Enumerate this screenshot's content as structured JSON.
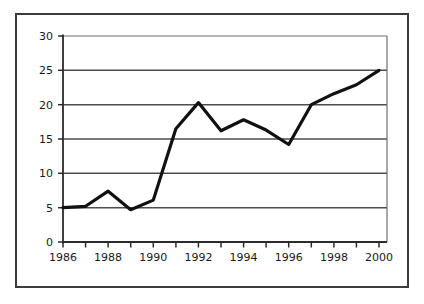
{
  "chart_data": {
    "type": "line",
    "title": "",
    "subtitle": "",
    "xlabel": "",
    "ylabel": "",
    "x": [
      1986,
      1987,
      1988,
      1989,
      1990,
      1991,
      1992,
      1993,
      1994,
      1995,
      1996,
      1997,
      1998,
      1999,
      2000
    ],
    "values": [
      5.0,
      5.2,
      7.4,
      4.7,
      6.1,
      16.5,
      20.3,
      16.2,
      17.8,
      16.3,
      14.2,
      20.0,
      21.6,
      22.9,
      25.0
    ],
    "series": [
      {
        "name": "",
        "values": [
          5.0,
          5.2,
          7.4,
          4.7,
          6.1,
          16.5,
          20.3,
          16.2,
          17.8,
          16.3,
          14.2,
          20.0,
          21.6,
          22.9,
          25.0
        ]
      }
    ],
    "xlim": [
      1986,
      2000
    ],
    "ylim": [
      0,
      30
    ],
    "ytick_labels": [
      "0",
      "5",
      "10",
      "15",
      "20",
      "25",
      "30"
    ],
    "ytick_values": [
      0,
      5,
      10,
      15,
      20,
      25,
      30
    ],
    "xtick_labels": [
      "1986",
      "1988",
      "1990",
      "1992",
      "1994",
      "1996",
      "1998",
      "2000"
    ],
    "xtick_values": [
      1986,
      1988,
      1990,
      1992,
      1994,
      1996,
      1998,
      2000
    ],
    "xminor_tick_values": [
      1986,
      1987,
      1988,
      1989,
      1990,
      1991,
      1992,
      1993,
      1994,
      1995,
      1996,
      1997,
      1998,
      1999,
      2000
    ],
    "grid": "horizontal",
    "legend": "none",
    "line_color": "#111111",
    "grid_color": "#4d4d4d",
    "axis_color": "#333333",
    "frame_color": "#3c3c3c",
    "background_color": "#ffffff",
    "line_width": 3.2,
    "annotations": []
  },
  "labels": {
    "y_0": "0",
    "y_5": "5",
    "y_10": "10",
    "y_15": "15",
    "y_20": "20",
    "y_25": "25",
    "y_30": "30",
    "x_1986": "1986",
    "x_1988": "1988",
    "x_1990": "1990",
    "x_1992": "1992",
    "x_1994": "1994",
    "x_1996": "1996",
    "x_1998": "1998",
    "x_2000": "2000"
  }
}
